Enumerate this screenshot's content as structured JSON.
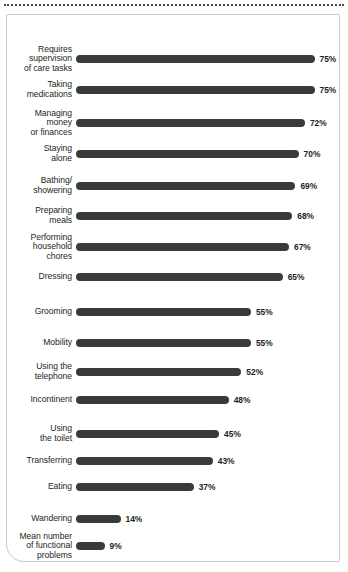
{
  "chart_data": {
    "type": "bar",
    "orientation": "horizontal",
    "title": "",
    "subtitle": "",
    "xlabel": "",
    "ylabel": "",
    "xlim": [
      0,
      75
    ],
    "grid": false,
    "legend": null,
    "value_suffix": "%",
    "bar_color": "#3a3a3a",
    "categories": [
      "Requires\nsupervision\nof care tasks",
      "Taking\nmedications",
      "Managing\nmoney\nor finances",
      "Staying\nalone",
      "Bathing/\nshowering",
      "Preparing\nmeals",
      "Performing\nhousehold\nchores",
      "Dressing",
      "Grooming",
      "Mobility",
      "Using the\ntelephone",
      "Incontinent",
      "Using\nthe toilet",
      "Transferring",
      "Eating",
      "Wandering",
      "Mean number\nof functional\nproblems"
    ],
    "values": [
      75,
      75,
      72,
      70,
      69,
      68,
      67,
      65,
      55,
      55,
      52,
      48,
      45,
      43,
      37,
      14,
      9
    ],
    "value_labels": [
      "75%",
      "75%",
      "72%",
      "70%",
      "69%",
      "68%",
      "67%",
      "65%",
      "55%",
      "55%",
      "52%",
      "48%",
      "45%",
      "43%",
      "37%",
      "14%",
      "9%"
    ],
    "rows": [
      {
        "label": "Requires\nsupervision\nof care tasks",
        "value": 75,
        "value_label": "75%",
        "y": 44
      },
      {
        "label": "Taking\nmedications",
        "value": 75,
        "value_label": "75%",
        "y": 75
      },
      {
        "label": "Managing\nmoney\nor finances",
        "value": 72,
        "value_label": "72%",
        "y": 108
      },
      {
        "label": "Staying\nalone",
        "value": 70,
        "value_label": "70%",
        "y": 139
      },
      {
        "label": "Bathing/\nshowering",
        "value": 69,
        "value_label": "69%",
        "y": 171
      },
      {
        "label": "Preparing\nmeals",
        "value": 68,
        "value_label": "68%",
        "y": 201
      },
      {
        "label": "Performing\nhousehold\nchores",
        "value": 67,
        "value_label": "67%",
        "y": 232
      },
      {
        "label": "Dressing",
        "value": 65,
        "value_label": "65%",
        "y": 262
      },
      {
        "label": "Grooming",
        "value": 55,
        "value_label": "55%",
        "y": 297
      },
      {
        "label": "Mobility",
        "value": 55,
        "value_label": "55%",
        "y": 328
      },
      {
        "label": "Using the\ntelephone",
        "value": 52,
        "value_label": "52%",
        "y": 357
      },
      {
        "label": "Incontinent",
        "value": 48,
        "value_label": "48%",
        "y": 385
      },
      {
        "label": "Using\nthe toilet",
        "value": 45,
        "value_label": "45%",
        "y": 419
      },
      {
        "label": "Transferring",
        "value": 43,
        "value_label": "43%",
        "y": 446
      },
      {
        "label": "Eating",
        "value": 37,
        "value_label": "37%",
        "y": 472
      },
      {
        "label": "Wandering",
        "value": 14,
        "value_label": "14%",
        "y": 504
      },
      {
        "label": "Mean number\nof functional\nproblems",
        "value": 9,
        "value_label": "9%",
        "y": 531
      }
    ]
  },
  "layout": {
    "bar_origin_x": 69,
    "px_per_unit": 3.18,
    "bar_height": 8,
    "value_gap": 5
  }
}
